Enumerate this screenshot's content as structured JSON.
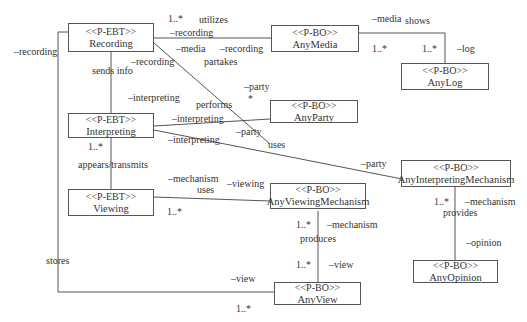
{
  "classes": {
    "recording": {
      "stereotype": "<<P-EBT>>",
      "name": "Recording"
    },
    "interpreting": {
      "stereotype": "<<P-EBT>>",
      "name": "Interpreting"
    },
    "viewing": {
      "stereotype": "<<P-EBT>>",
      "name": "Viewing"
    },
    "any_media": {
      "stereotype": "<<P-BO>>",
      "name": "AnyMedia"
    },
    "any_log": {
      "stereotype": "<<P-BO>>",
      "name": "AnyLog"
    },
    "any_party": {
      "stereotype": "<<P-BO>>",
      "name": "AnyParty"
    },
    "any_interpreting_mechanism": {
      "stereotype": "<<P-BO>>",
      "name": "AnyInterpretingMechanism"
    },
    "any_viewing_mechanism": {
      "stereotype": "<<P-BO>>",
      "name": "AnyViewingMechanism"
    },
    "any_opinion": {
      "stereotype": "<<P-BO>>",
      "name": "AnyOpinion"
    },
    "any_view": {
      "stereotype": "<<P-BO>>",
      "name": "AnyView"
    }
  },
  "labels": {
    "utilizes_mult": "1..*",
    "utilizes": "utilizes",
    "utilizes_role_recording": "–recording",
    "utilizes_role_media": "–media",
    "recording_left": "–recording",
    "partakes_role_recording": "–recording",
    "partakes": "partakes",
    "partakes_role_party": "–party",
    "partakes_mult": "*",
    "sends_info": "sends info",
    "sends_role_recording": "–recording",
    "sends_role_interpreting": "–interpreting",
    "performs": "performs",
    "performs_role_interpreting": "–interpreting",
    "performs_role_party": "–party",
    "uses_role_interpreting": "–interpreting",
    "uses_interp": "uses",
    "uses_role_party": "–party",
    "interp_mult": "1..*",
    "appears_transmits": "appears/transmits",
    "media_role": "–media",
    "shows": "shows",
    "shows_mult_media": "1..*",
    "shows_mult_log": "1..*",
    "log_role": "–log",
    "uses_view_role_mechanism": "–mechanism",
    "uses_view": "uses",
    "uses_view_role_viewing": "–viewing",
    "viewing_mult": "1..*",
    "provides_mult": "1..*",
    "provides_role_mechanism": "–mechanism",
    "provides": "provides",
    "opinion_role": "–opinion",
    "produces_mult_top": "1..*",
    "produces_role_mechanism": "–mechanism",
    "produces": "produces",
    "produces_mult_bottom": "1..*",
    "produces_role_view": "–view",
    "stores": "stores",
    "stores_role_view": "–view",
    "stores_mult": "1..*"
  }
}
